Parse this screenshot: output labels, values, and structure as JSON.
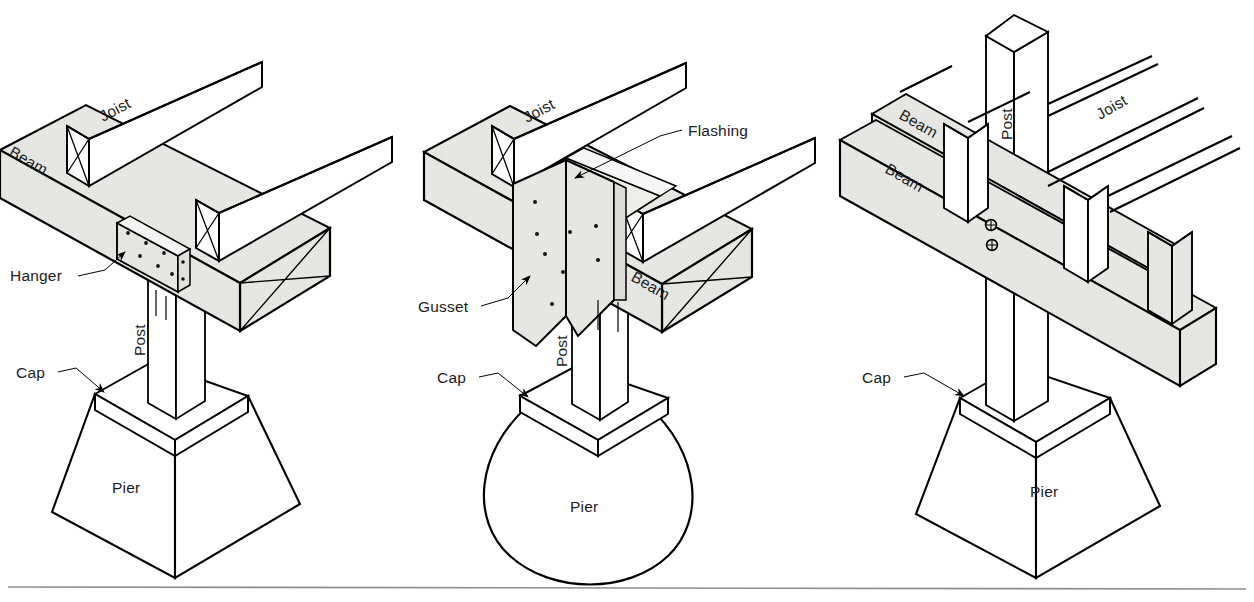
{
  "figure": {
    "background_color": "#ffffff",
    "line_color": "#000000",
    "shade_color": "#e7e7e4",
    "text_color": "#1c1c1c",
    "baseline_rule_color": "#8d8d8d"
  },
  "details": [
    {
      "id": "detail-hanger",
      "name": "Post with metal hanger strap",
      "labels": {
        "joist": "Joist",
        "beam": "Beam",
        "hanger": "Hanger",
        "post": "Post",
        "cap": "Cap",
        "pier": "Pier"
      },
      "pier_shape": "tapered-square",
      "hardware": "metal strap hanger with bolt holes",
      "bolt_hole_count": 8
    },
    {
      "id": "detail-gusset",
      "name": "Post with gusset plate and flashing",
      "labels": {
        "joist": "Joist",
        "beam": "Beam",
        "flashing": "Flashing",
        "gusset": "Gusset",
        "post": "Post",
        "cap": "Cap",
        "pier": "Pier"
      },
      "pier_shape": "rounded-conical",
      "hardware": "gusset plate with bolt holes",
      "bolt_hole_count": 8
    },
    {
      "id": "detail-through-post",
      "name": "Continuous post with bolted sandwich beams",
      "labels": {
        "joist": "Joist",
        "beam_upper": "Beam",
        "beam_lower": "Beam",
        "post": "Post",
        "cap": "Cap",
        "pier": "Pier"
      },
      "pier_shape": "tapered-square",
      "hardware": "through bolts",
      "bolt_count": 2
    }
  ]
}
